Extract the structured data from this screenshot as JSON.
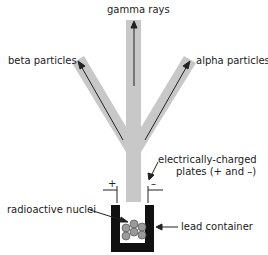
{
  "labels": {
    "gamma": "gamma rays",
    "beta": "beta particles",
    "alpha": "alpha particles",
    "plates_line1": "electrically-charged",
    "plates_line2": "plates (+ and –)",
    "nuclei": "radioactive nuclei",
    "container": "lead container",
    "plus": "+",
    "minus": "–"
  },
  "colors": {
    "beam": "#c8c8c8",
    "container": "#111111",
    "nucleus": "#9a9a9a",
    "arrow": "#222222"
  }
}
